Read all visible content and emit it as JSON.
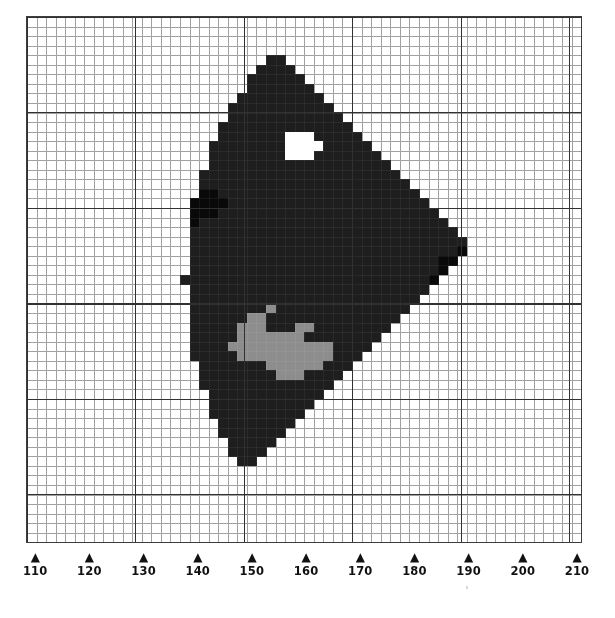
{
  "figure": {
    "type": "pixel-map"
  },
  "axis": {
    "name": "x-axis",
    "min": 110,
    "max": 210,
    "step": 10,
    "tick_marker": "▲",
    "ticks": [
      {
        "label": "110",
        "value": 110
      },
      {
        "label": "120",
        "value": 120
      },
      {
        "label": "130",
        "value": 130
      },
      {
        "label": "140",
        "value": 140
      },
      {
        "label": "150",
        "value": 150
      },
      {
        "label": "160",
        "value": 160
      },
      {
        "label": "170",
        "value": 170
      },
      {
        "label": "180",
        "value": 180
      },
      {
        "label": "190",
        "value": 190
      },
      {
        "label": "200",
        "value": 200
      },
      {
        "label": "210",
        "value": 210
      }
    ]
  },
  "grid": {
    "fine_cell_px": 9.56,
    "major_every_cells": 5,
    "fine_color": "#9a9a9a",
    "major_color": "#313131",
    "frame_color": "#3d3d3d"
  },
  "colors": {
    "background": "#ffffff",
    "region_dark": "#1e1e1e",
    "region_darker": "#090909",
    "blob_mid_gray": "#8d8d8d",
    "blob_light_gray": "#c9c9c9",
    "blob_white": "#ffffff"
  },
  "chart_data": {
    "type": "heatmap",
    "title": "",
    "xlabel": "",
    "ylabel": "",
    "xlim": [
      110,
      210
    ],
    "grid": true,
    "legend": "none",
    "levels": [
      {
        "name": "background",
        "color": "#ffffff",
        "order": 0
      },
      {
        "name": "dark-region",
        "color": "#1e1e1e",
        "order": 1
      },
      {
        "name": "darker-core",
        "color": "#090909",
        "order": 2
      },
      {
        "name": "mid-gray",
        "color": "#8d8d8d",
        "order": 3
      },
      {
        "name": "light-gray",
        "color": "#c9c9c9",
        "order": 4
      },
      {
        "name": "white-spot",
        "color": "#ffffff",
        "order": 5
      }
    ],
    "features": [
      {
        "name": "white-notch-top-left",
        "level": "white-spot",
        "cx": 116,
        "cy": 114,
        "w": 34,
        "h": 10
      },
      {
        "name": "white-spot-upper",
        "level": "white-spot",
        "cx": 160,
        "cy": 237,
        "w": 31,
        "h": 29
      },
      {
        "name": "white-spot-left",
        "level": "white-spot",
        "cx": 126,
        "cy": 203,
        "w": 22,
        "h": 22
      },
      {
        "name": "dark-streak-upper-left",
        "level": "darker-core",
        "cx": 138,
        "cy": 226,
        "w": 96,
        "h": 48
      },
      {
        "name": "dark-streak-right",
        "level": "darker-core",
        "cx": 190,
        "cy": 217,
        "w": 72,
        "h": 54
      },
      {
        "name": "gray-blob-center",
        "level": "mid-gray",
        "cx": 154,
        "cy": 180,
        "w": 86,
        "h": 76
      },
      {
        "name": "gray-blob-lower",
        "level": "light-gray",
        "cx": 157,
        "cy": 148,
        "w": 66,
        "h": 58
      }
    ]
  }
}
